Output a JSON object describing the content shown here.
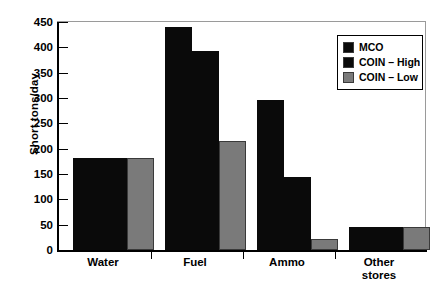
{
  "chart_data": {
    "type": "bar",
    "title": "",
    "xlabel": "",
    "ylabel": "Short tons/day",
    "ylim": [
      0,
      450
    ],
    "yticks": [
      0,
      50,
      100,
      150,
      200,
      250,
      300,
      350,
      400,
      450
    ],
    "ytick_labels": [
      "0",
      "50",
      "100",
      "150",
      "200",
      "250",
      "300",
      "350",
      "400",
      "450"
    ],
    "grid": false,
    "legend_position": "upper right",
    "categories": [
      "Water",
      "Fuel",
      "Ammo",
      "Other\nstores"
    ],
    "category_labels": [
      "Water",
      "Fuel",
      "Ammo",
      "Other stores"
    ],
    "series": [
      {
        "name": "MCO",
        "color": "#0a0a0a",
        "values": [
          182,
          440,
          296,
          45
        ]
      },
      {
        "name": "COIN – High",
        "color": "#0a0a0a",
        "values": [
          181,
          393,
          145,
          45
        ]
      },
      {
        "name": "COIN – Low",
        "color": "#7a7a7a",
        "values": [
          181,
          215,
          22,
          45
        ]
      }
    ]
  },
  "legend": {
    "items": [
      {
        "label": "MCO",
        "color": "#0a0a0a"
      },
      {
        "label": "COIN – High",
        "color": "#0a0a0a"
      },
      {
        "label": "COIN – Low",
        "color": "#7a7a7a"
      }
    ]
  },
  "axis": {
    "y_title": "Short tons/day"
  }
}
